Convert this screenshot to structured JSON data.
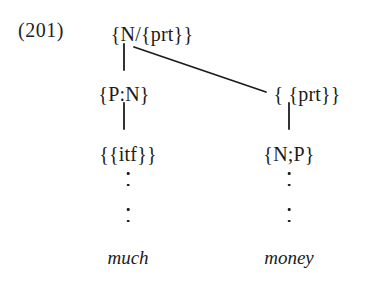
{
  "figure": {
    "example_number": "(201)",
    "background_color": "#ffffff",
    "ink_color": "#1c1c1c",
    "tree": {
      "root": {
        "label": "{N/{prt}}",
        "x": 152,
        "y": 24
      },
      "left_branch": {
        "mid_label": "{P:N}",
        "mid_x": 124,
        "mid_y": 84,
        "lower_label": "{{itf}}",
        "lower_x": 128,
        "lower_y": 144,
        "terminal": "much",
        "terminal_x": 128,
        "terminal_y": 248
      },
      "right_branch": {
        "mid_label": "{ {prt}}",
        "mid_x": 307,
        "mid_y": 84,
        "lower_label": "{N;P}",
        "lower_x": 289,
        "lower_y": 144,
        "terminal": "money",
        "terminal_x": 289,
        "terminal_y": 248
      }
    },
    "edges": {
      "root_to_left_stem": {
        "x1": 124,
        "y1": 44,
        "x2": 124,
        "y2": 70
      },
      "root_to_right_diagonal": {
        "x1": 134,
        "y1": 47,
        "x2": 266,
        "y2": 92
      },
      "left_mid_to_lower_stem": {
        "x1": 124,
        "y1": 103,
        "x2": 124,
        "y2": 129
      },
      "right_mid_to_lower_stem": {
        "x1": 289,
        "y1": 103,
        "x2": 289,
        "y2": 129
      },
      "stroke_width": 1.8
    },
    "ellipses": {
      "left_upper": {
        "x": 128,
        "y": 172,
        "dots": 2
      },
      "left_lower": {
        "x": 128,
        "y": 208,
        "dots": 2
      },
      "right_upper": {
        "x": 289,
        "y": 172,
        "dots": 2
      },
      "right_lower": {
        "x": 289,
        "y": 208,
        "dots": 2
      }
    }
  }
}
